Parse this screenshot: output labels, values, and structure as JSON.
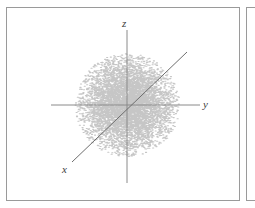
{
  "figure": {
    "title": "",
    "caption": "",
    "background_color": "#ffffff",
    "frame_color": "#9a9a9a"
  },
  "panels": [
    {
      "id": "main",
      "label": "main-plot-panel",
      "visible": true
    },
    {
      "id": "secondary",
      "label": "adjacent-panel-clipped",
      "visible": true
    }
  ],
  "axes": {
    "z": {
      "label": "z",
      "orientation": "vertical",
      "color": "#8a8a8a",
      "x1": 127,
      "y1": 30,
      "x2": 127,
      "y2": 183
    },
    "y": {
      "label": "y",
      "orientation": "horizontal",
      "color": "#8a8a8a",
      "x1": 51,
      "y1": 105,
      "x2": 200,
      "y2": 105
    },
    "x": {
      "label": "x",
      "orientation": "diagonal",
      "color": "#6e6e6e",
      "x1": 72,
      "y1": 162,
      "x2": 187,
      "y2": 52
    }
  },
  "chart_data": {
    "type": "scatter",
    "title": "",
    "subtitle": "",
    "xlabel": "y",
    "ylabel": "z",
    "zlabel": "x",
    "grid": false,
    "legend": null,
    "origin": {
      "x": 127,
      "y": 105
    },
    "point_count": 9000,
    "point_color": "#8e8e8e",
    "point_opacity": 0.5,
    "point_radius": 0.55,
    "distribution": "gaussian-isotropic",
    "sigma_x": 22,
    "sigma_y": 22,
    "cloud_radius": 52,
    "xlim": [
      -75,
      75
    ],
    "ylim": [
      -75,
      75
    ],
    "annotations": [
      {
        "text": "z",
        "x": 122,
        "y": 18
      },
      {
        "text": "y",
        "x": 203,
        "y": 99
      },
      {
        "text": "x",
        "x": 62,
        "y": 164
      }
    ]
  }
}
